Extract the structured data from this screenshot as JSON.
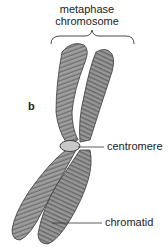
{
  "figure": {
    "title_line1": "metaphase",
    "title_line2": "chromosome",
    "panel_label": "b",
    "labels": {
      "centromere": "centromere",
      "chromatid": "chromatid"
    },
    "colors": {
      "chromatid_fill": "#8a8a8a",
      "chromatid_stroke": "#3a3a3a",
      "centromere_fill": "#c8c8c8",
      "line": "#333333"
    }
  }
}
